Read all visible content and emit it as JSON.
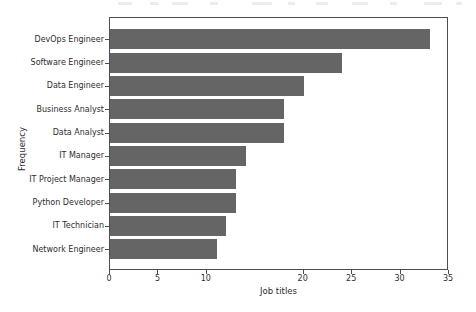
{
  "chart_data": {
    "type": "bar",
    "orientation": "horizontal",
    "title": "",
    "xlabel": "Job titles",
    "ylabel": "Frequency",
    "categories": [
      "DevOps Engineer",
      "Software Engineer",
      "Data Engineer",
      "Business Analyst",
      "Data Analyst",
      "IT Manager",
      "IT Project Manager",
      "Python Developer",
      "IT Technician",
      "Network Engineer"
    ],
    "values": [
      33,
      24,
      20,
      18,
      18,
      14,
      13,
      13,
      12,
      11
    ],
    "xlim": [
      0,
      35
    ],
    "x_ticks": [
      0,
      5,
      10,
      20,
      25,
      30,
      35
    ],
    "bar_color": "#656565",
    "axis_color": "#4f4f4f",
    "text_color": "#2e2e2e",
    "background_color": "#ffffff",
    "grid": false,
    "legend": false
  }
}
